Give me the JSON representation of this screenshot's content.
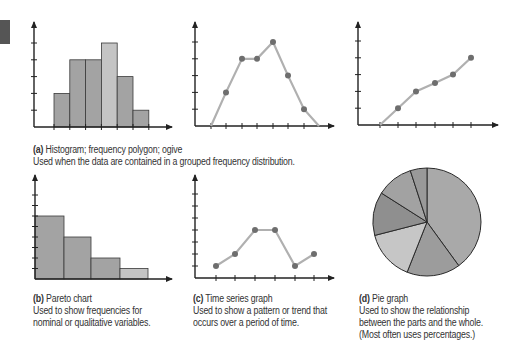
{
  "figure": {
    "panels": {
      "a": {
        "label": "(a)",
        "title": "Histogram; frequency polygon; ogive",
        "description": "Used when the data are contained in a grouped frequency distribution."
      },
      "b": {
        "label": "(b)",
        "title": "Pareto chart",
        "description_lines": [
          "Used to show frequencies for",
          "nominal or qualitative variables."
        ]
      },
      "c": {
        "label": "(c)",
        "title": "Time series graph",
        "description_lines": [
          "Used to show a pattern or trend that",
          "occurs over a period of time."
        ]
      },
      "d": {
        "label": "(d)",
        "title": "Pie graph",
        "description_lines": [
          "Used to show the relationship",
          "between the parts and the whole.",
          "(Most often uses percentages.)"
        ]
      }
    },
    "colors": {
      "bar_fill": "#a3a3a3",
      "bar_fill_light": "#c4c4c4",
      "bar_stroke": "#3a3a3a",
      "line": "#b0b0b0",
      "point": "#6e6e6e",
      "axis": "#222222",
      "pie_slices": [
        "#a9a9a9",
        "#9c9c9c",
        "#c6c6c6",
        "#8f8f8f",
        "#a2a2a2",
        "#999999"
      ],
      "tab_marker": "#555555"
    }
  },
  "chart_data": [
    {
      "type": "bar",
      "title": "Histogram",
      "categories": [
        "1",
        "2",
        "3",
        "4",
        "5",
        "6"
      ],
      "values": [
        2,
        4,
        4,
        5,
        3,
        1
      ],
      "xlabel": "",
      "ylabel": "",
      "ylim": [
        0,
        5.8
      ],
      "grid": false,
      "legend": null
    },
    {
      "type": "line",
      "title": "Frequency polygon",
      "x": [
        0,
        1,
        2,
        3,
        4,
        5,
        6,
        7
      ],
      "values": [
        0,
        2,
        4,
        4,
        5,
        3,
        1,
        0
      ],
      "xlabel": "",
      "ylabel": "",
      "ylim": [
        0,
        5.8
      ],
      "grid": false
    },
    {
      "type": "line",
      "title": "Ogive",
      "x": [
        0,
        1,
        2,
        3,
        4,
        5
      ],
      "values": [
        0,
        1,
        2,
        2.5,
        3,
        4
      ],
      "xlabel": "",
      "ylabel": "",
      "ylim": [
        0,
        5.8
      ],
      "grid": false
    },
    {
      "type": "bar",
      "title": "Pareto chart",
      "categories": [
        "A",
        "B",
        "C",
        "D"
      ],
      "values": [
        6,
        4,
        2,
        1
      ],
      "xlabel": "",
      "ylabel": "",
      "ylim": [
        0,
        9
      ],
      "grid": false
    },
    {
      "type": "line",
      "title": "Time series graph",
      "x": [
        1,
        2,
        3,
        4,
        5,
        6
      ],
      "values": [
        1,
        2,
        4,
        4,
        1,
        2
      ],
      "xlabel": "",
      "ylabel": "",
      "ylim": [
        0,
        8
      ],
      "grid": false
    },
    {
      "type": "pie",
      "title": "Pie graph",
      "labels": [
        "Slice 1",
        "Slice 2",
        "Slice 3",
        "Slice 4",
        "Slice 5",
        "Slice 6"
      ],
      "values": [
        40,
        16,
        15,
        13,
        11,
        5
      ]
    }
  ]
}
